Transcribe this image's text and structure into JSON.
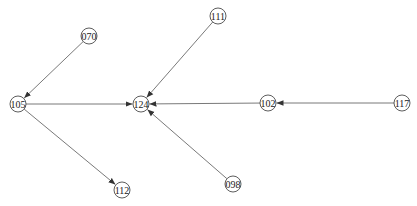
{
  "diagram": {
    "type": "directed-graph",
    "node_radius": 8,
    "colors": {
      "edge": "#6a6a6a",
      "arrow": "#333333",
      "node_stroke": "#333333",
      "node_fill": "#ffffff",
      "label": "#222222"
    },
    "nodes": [
      {
        "id": "070",
        "label": "070",
        "x": 89,
        "y": 36
      },
      {
        "id": "105",
        "label": "105",
        "x": 18,
        "y": 104
      },
      {
        "id": "124",
        "label": "124",
        "x": 141,
        "y": 104
      },
      {
        "id": "111",
        "label": "111",
        "x": 218,
        "y": 16
      },
      {
        "id": "102",
        "label": "102",
        "x": 268,
        "y": 103
      },
      {
        "id": "117",
        "label": "117",
        "x": 402,
        "y": 103
      },
      {
        "id": "098",
        "label": "098",
        "x": 233,
        "y": 184
      },
      {
        "id": "112",
        "label": "112",
        "x": 122,
        "y": 190
      }
    ],
    "edges": [
      {
        "from": "070",
        "to": "105"
      },
      {
        "from": "105",
        "to": "124"
      },
      {
        "from": "105",
        "to": "112"
      },
      {
        "from": "111",
        "to": "124"
      },
      {
        "from": "102",
        "to": "124"
      },
      {
        "from": "098",
        "to": "124"
      },
      {
        "from": "117",
        "to": "102"
      }
    ]
  }
}
